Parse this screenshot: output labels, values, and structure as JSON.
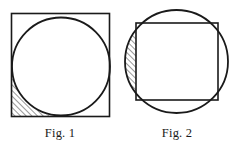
{
  "document": {
    "type": "geometry-figure-plate",
    "width": 236,
    "height": 146,
    "background_color": "#ffffff",
    "stroke_color": "#1a1a1a",
    "hatch_color": "#1a1a1a"
  },
  "figures": [
    {
      "id": "fig1",
      "caption": "Fig. 1",
      "description": "Circle inscribed in a square; the bottom-left corner region between the square corner and the circular arc is hatched.",
      "square": {
        "x": 11.5,
        "y": 13.5,
        "width": 98,
        "height": 103,
        "stroke_width": 1.6
      },
      "circle": {
        "cx": 61,
        "cy": 66.5,
        "r": 49,
        "stroke_width": 1.8
      },
      "shaded_region": {
        "name": "corner-lune-bottom-left",
        "hatch_direction": "forward-slash",
        "hatch_spacing": 4.0,
        "hatch_angle_deg": 45
      }
    },
    {
      "id": "fig2",
      "caption": "Fig. 2",
      "description": "Square inscribed in a circle, offset to the right; the left circular segment between the arc and the square's left edge is hatched.",
      "circle": {
        "cx": 176.5,
        "cy": 61.5,
        "r": 51.5,
        "stroke_width": 1.8
      },
      "square": {
        "x": 136,
        "y": 23,
        "width": 82,
        "height": 77,
        "stroke_width": 1.6
      },
      "shaded_region": {
        "name": "left-circular-segment",
        "hatch_direction": "forward-slash",
        "hatch_spacing": 4.0,
        "hatch_angle_deg": 45
      }
    }
  ],
  "captions": {
    "fig1": "Fig. 1",
    "fig2": "Fig. 2"
  }
}
